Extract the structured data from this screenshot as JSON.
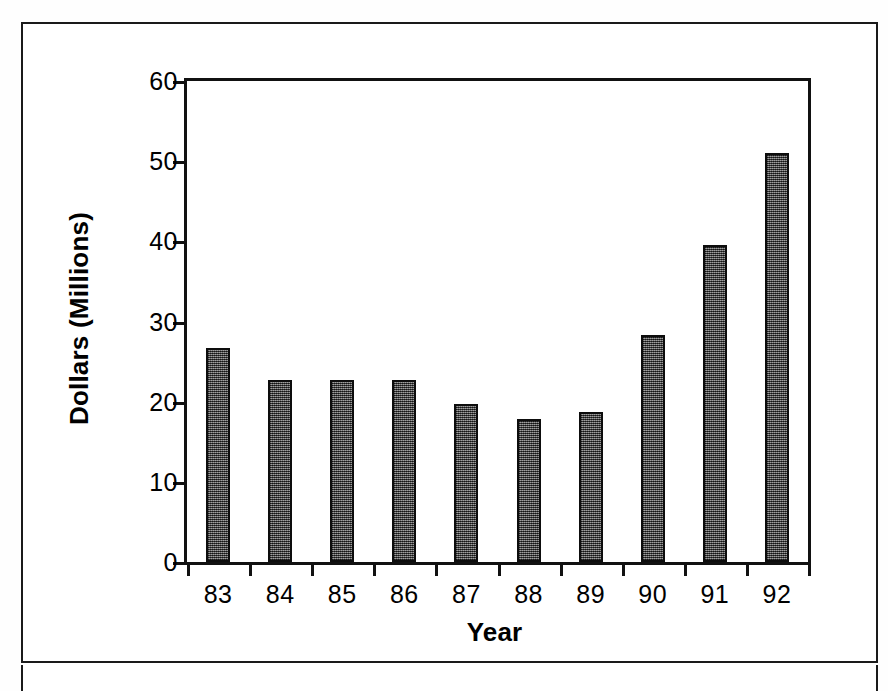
{
  "figure": {
    "frame_color": "#1a1a1a",
    "background": "#ffffff"
  },
  "chart_data": {
    "type": "bar",
    "title": "",
    "xlabel": "Year",
    "ylabel": "Dollars (Millions)",
    "categories": [
      "83",
      "84",
      "85",
      "86",
      "87",
      "88",
      "89",
      "90",
      "91",
      "92"
    ],
    "values": [
      26.7,
      22.7,
      22.7,
      22.7,
      19.7,
      17.8,
      18.7,
      28.3,
      39.5,
      51.0
    ],
    "ylim": [
      0,
      60
    ],
    "yticks": [
      0,
      10,
      20,
      30,
      40,
      50,
      60
    ],
    "ytick_labels": [
      "0",
      "10",
      "20",
      "30",
      "40",
      "50",
      "60"
    ],
    "xtick_labels": [
      "83",
      "84",
      "85",
      "86",
      "87",
      "88",
      "89",
      "90",
      "91",
      "92"
    ],
    "grid": false,
    "legend": null,
    "bar_color": "#4f4f4f",
    "bar_edge_color": "#0d0d0d",
    "axis_color": "#111111"
  }
}
